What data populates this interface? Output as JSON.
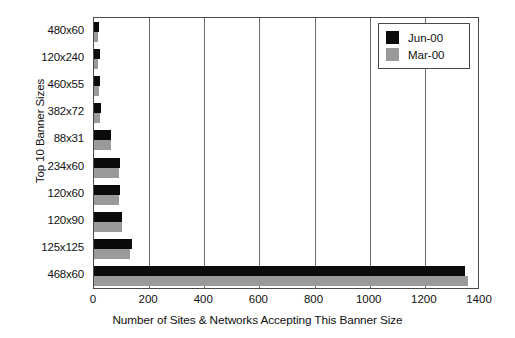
{
  "chart_data": {
    "type": "bar",
    "orientation": "horizontal",
    "title": "",
    "xlabel": "Number of Sites & Networks Accepting This Banner Size",
    "ylabel": "Top 10 Banner Sizes",
    "categories": [
      "480x60",
      "120x240",
      "460x55",
      "382x72",
      "88x31",
      "234x60",
      "120x60",
      "120x90",
      "125x125",
      "468x60"
    ],
    "series": [
      {
        "name": "Jun-00",
        "color": "#0b0b0b",
        "values": [
          18,
          20,
          22,
          24,
          62,
          95,
          95,
          100,
          138,
          1345
        ]
      },
      {
        "name": "Mar-00",
        "color": "#9a9a9a",
        "values": [
          14,
          16,
          18,
          20,
          62,
          92,
          92,
          100,
          130,
          1355
        ]
      }
    ],
    "xlim": [
      0,
      1400
    ],
    "xticks": [
      0,
      200,
      400,
      600,
      800,
      1000,
      1200,
      1400
    ],
    "xtick_labels": [
      "0",
      "200",
      "400",
      "600",
      "800",
      "1000",
      "1200",
      "1400"
    ],
    "grid": "vertical",
    "legend_position": "top-right"
  },
  "legend": {
    "entries": [
      {
        "label": "Jun-00"
      },
      {
        "label": "Mar-00"
      }
    ]
  }
}
